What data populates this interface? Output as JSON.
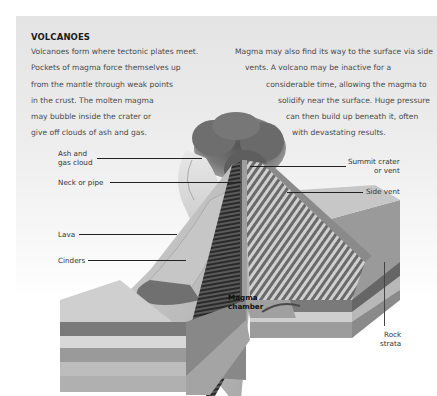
{
  "title": "VOLCANOES",
  "paragraph_left": {
    "lines": [
      "Volcanoes form where tectonic plates meet.",
      "Pockets of magma force themselves up",
      "from the mantle through weak points",
      "in the crust. The molten magma",
      "may bubble inside the crater or",
      "give off clouds of ash and gas."
    ]
  },
  "paragraph_right": {
    "lines": [
      "Magma may also find its way to the surface via side",
      "vents. A volcano may be inactive for a",
      "considerable time, allowing the magma to",
      "solidify near the surface. Huge pressure",
      "can then build up beneath it, often",
      "with devastating results."
    ]
  },
  "labels": {
    "ash_cloud": [
      "Ash and",
      "gas cloud"
    ],
    "neck": "Neck or pipe",
    "lava": "Lava",
    "cinders": "Cinders",
    "summit": [
      "Summit crater",
      "or vent"
    ],
    "side_vent": "Side vent",
    "magma_chamber": [
      "Magma",
      "chamber"
    ],
    "rock_strata": [
      "Rock",
      "strata"
    ]
  },
  "colors": {
    "background_panel": "#e8e8e8",
    "text": "#4a4a4a",
    "title": "#1a1a1a",
    "leader_lines": "#222222"
  }
}
